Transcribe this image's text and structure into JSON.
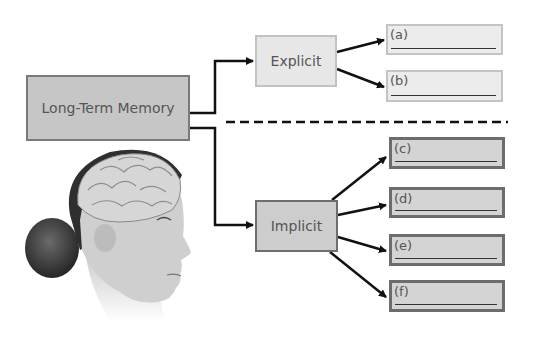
{
  "diagram": {
    "root": {
      "label": "Long-Term Memory"
    },
    "branches": [
      {
        "label": "Explicit",
        "answers": [
          "(a)",
          "(b)"
        ]
      },
      {
        "label": "Implicit",
        "answers": [
          "(c)",
          "(d)",
          "(e)",
          "(f)"
        ]
      }
    ],
    "separator": "dashed-line",
    "illustration": "head-with-brain-profile"
  },
  "colors": {
    "line": "#111111",
    "explicit_fill": "#e7e7e7",
    "implicit_fill": "#cdcdcd",
    "root_fill": "#c6c6c6"
  }
}
